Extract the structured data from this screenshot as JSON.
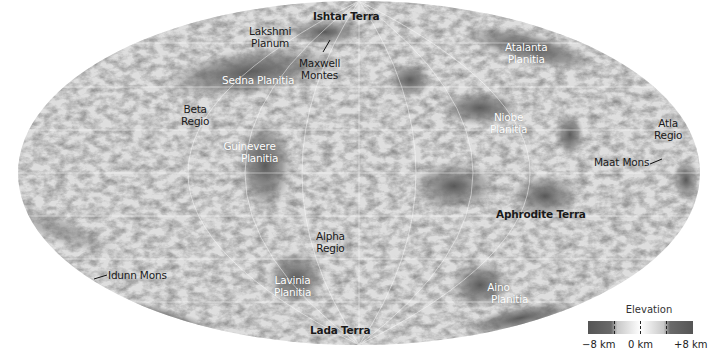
{
  "map": {
    "subject": "Venus surface elevation map",
    "projection": "Mollweide (elliptical)",
    "labels": [
      {
        "id": "ishtar-terra",
        "lines": [
          "Ishtar Terra"
        ],
        "style": "dark bold",
        "x": 313,
        "y": 16
      },
      {
        "id": "lakshmi-planum",
        "lines": [
          "Lakshmi",
          "Planum"
        ],
        "style": "dark",
        "x": 255,
        "y": 28
      },
      {
        "id": "maxwell-montes",
        "lines": [
          "Maxwell",
          "Montes"
        ],
        "style": "dark",
        "x": 300,
        "y": 58
      },
      {
        "id": "atalanta-planitia",
        "lines": [
          "Atalanta",
          "Planitia"
        ],
        "style": "light",
        "x": 505,
        "y": 41
      },
      {
        "id": "sedna-planitia",
        "lines": [
          "Sedna Planitia"
        ],
        "style": "light",
        "x": 225,
        "y": 75
      },
      {
        "id": "beta-regio",
        "lines": [
          "Beta",
          "Regio"
        ],
        "style": "dark",
        "x": 179,
        "y": 104
      },
      {
        "id": "niobe-planitia",
        "lines": [
          "Niobe",
          "Planitia"
        ],
        "style": "light",
        "x": 488,
        "y": 111
      },
      {
        "id": "atla-regio",
        "lines": [
          "Atla",
          "Regio"
        ],
        "style": "dark",
        "x": 652,
        "y": 118
      },
      {
        "id": "guinevere-planitia",
        "lines": [
          "Guinevere",
          "Planitia"
        ],
        "style": "light",
        "x": 221,
        "y": 141
      },
      {
        "id": "maat-mons",
        "lines": [
          "Maat Mons"
        ],
        "style": "dark",
        "x": 593,
        "y": 158
      },
      {
        "id": "aphrodite-terra",
        "lines": [
          "Aphrodite Terra"
        ],
        "style": "dark bold",
        "x": 496,
        "y": 209
      },
      {
        "id": "alpha-regio",
        "lines": [
          "Alpha",
          "Regio"
        ],
        "style": "dark",
        "x": 316,
        "y": 231
      },
      {
        "id": "idunn-mons",
        "lines": [
          "Idunn Mons"
        ],
        "style": "dark",
        "x": 108,
        "y": 271
      },
      {
        "id": "lavinia-planitia",
        "lines": [
          "Lavinia",
          "Planitia"
        ],
        "style": "light",
        "x": 273,
        "y": 275
      },
      {
        "id": "aino-planitia",
        "lines": [
          "Aino",
          "Planitia"
        ],
        "style": "light",
        "x": 468,
        "y": 280
      },
      {
        "id": "lada-terra",
        "lines": [
          "Lada Terra"
        ],
        "style": "dark bold",
        "x": 310,
        "y": 325
      }
    ],
    "leaders": [
      {
        "id": "maxwell-leader",
        "x1": 323,
        "y1": 52,
        "x2": 330,
        "y2": 40
      },
      {
        "id": "maat-leader",
        "x1": 650,
        "y1": 164,
        "x2": 662,
        "y2": 159
      },
      {
        "id": "idunn-leader",
        "x1": 94,
        "y1": 279,
        "x2": 107,
        "y2": 275
      }
    ]
  },
  "legend": {
    "title": "Elevation",
    "min_label": "−8 km",
    "mid_label": "0 km",
    "max_label": "+8 km",
    "colors": {
      "low": "#555555",
      "mid": "#ffffff",
      "high": "#555555"
    }
  }
}
